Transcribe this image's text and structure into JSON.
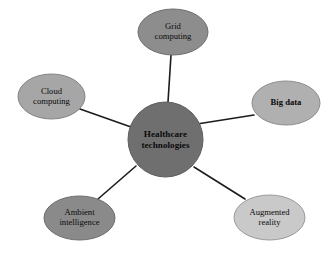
{
  "diagram": {
    "type": "hub-and-spoke",
    "background_color": "#ffffff",
    "edge_color": "#1c1c1c",
    "center": {
      "id": "healthcare-technologies",
      "label_line1": "Healthcare",
      "label_line2": "technologies",
      "shape": "circle",
      "fill": "#6f6f6f",
      "stroke": "#5d5d5d",
      "cx": 165.5,
      "cy": 139.5,
      "r": 37.5
    },
    "nodes": [
      {
        "id": "grid-computing",
        "label_line1": "Grid",
        "label_line2": "computing",
        "shape": "ellipse",
        "fill": "#8d8d8d",
        "stroke": "#6e6e6e",
        "cx": 173,
        "cy": 32,
        "rx": 35,
        "ry": 23,
        "bold": false
      },
      {
        "id": "big-data",
        "label_line1": "Big data",
        "label_line2": "",
        "shape": "ellipse",
        "fill": "#b0b0b0",
        "stroke": "#8c8c8c",
        "cx": 286,
        "cy": 103,
        "rx": 34,
        "ry": 22,
        "bold": true
      },
      {
        "id": "augmented-reality",
        "label_line1": "Augmented",
        "label_line2": "reality",
        "shape": "ellipse",
        "fill": "#c9c9c9",
        "stroke": "#9a9a9a",
        "cx": 269.5,
        "cy": 217.5,
        "rx": 35.5,
        "ry": 22.5,
        "bold": false
      },
      {
        "id": "ambient-intelligence",
        "label_line1": "Ambient",
        "label_line2": "intelligence",
        "shape": "ellipse",
        "fill": "#8a8a8a",
        "stroke": "#6c6c6c",
        "cx": 79.5,
        "cy": 218,
        "rx": 35.5,
        "ry": 22,
        "bold": false
      },
      {
        "id": "cloud-computing",
        "label_line1": "Cloud",
        "label_line2": "computing",
        "shape": "ellipse",
        "fill": "#a6a6a6",
        "stroke": "#838383",
        "cx": 51.5,
        "cy": 96.5,
        "rx": 33.5,
        "ry": 22.5,
        "bold": false
      }
    ],
    "edges": [
      {
        "id": "edge-center-grid-computing",
        "from": "healthcare-technologies",
        "to": "grid-computing",
        "x1": 168,
        "y1": 102,
        "x2": 171,
        "y2": 55
      },
      {
        "id": "edge-center-big-data",
        "from": "healthcare-technologies",
        "to": "big-data",
        "x1": 197,
        "y1": 124,
        "x2": 254,
        "y2": 115
      },
      {
        "id": "edge-center-augmented-reality",
        "from": "healthcare-technologies",
        "to": "augmented-reality",
        "x1": 194,
        "y1": 167,
        "x2": 245,
        "y2": 199
      },
      {
        "id": "edge-center-ambient-intelligence",
        "from": "healthcare-technologies",
        "to": "ambient-intelligence",
        "x1": 136,
        "y1": 166,
        "x2": 98,
        "y2": 199
      },
      {
        "id": "edge-center-cloud-computing",
        "from": "healthcare-technologies",
        "to": "cloud-computing",
        "x1": 131,
        "y1": 127,
        "x2": 80,
        "y2": 109
      }
    ]
  }
}
